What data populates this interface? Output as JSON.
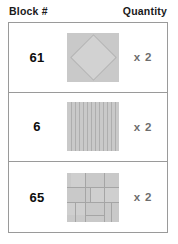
{
  "header": {
    "block_column_label": "Block #",
    "quantity_column_label": "Quantity"
  },
  "colors": {
    "swatch_fill": "#c9c9c9",
    "pattern_line": "#a5a5a5",
    "table_border": "#9a9a9a",
    "number_text": "#0d0d0d",
    "quantity_text": "#6d6d6d",
    "header_text": "#1a1a1a"
  },
  "rows": [
    {
      "block_number": "61",
      "quantity": "x 2",
      "pattern_name": "diamond-in-square-pattern"
    },
    {
      "block_number": "6",
      "quantity": "x 2",
      "pattern_name": "vertical-stripes-pattern"
    },
    {
      "block_number": "65",
      "quantity": "x 2",
      "pattern_name": "patchwork-grid-pattern"
    }
  ]
}
